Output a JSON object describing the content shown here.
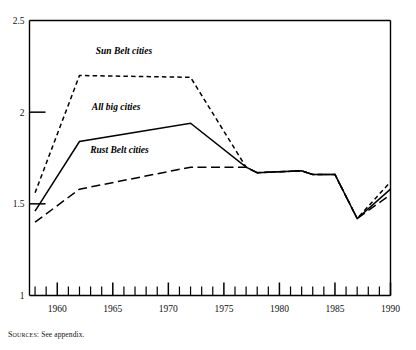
{
  "figure": {
    "source_note_prefix": "Sources:",
    "source_note_text": " See appendix."
  },
  "chart_data": {
    "type": "line",
    "title": "",
    "subtitle": "",
    "xlabel": "",
    "ylabel": "",
    "xlim": [
      1957.5,
      1990
    ],
    "ylim": [
      1,
      2.5
    ],
    "grid": false,
    "legend_position": "inline-annotations",
    "y_ticks": [
      1,
      1.5,
      2,
      2.5
    ],
    "y_tick_labels": [
      "1",
      "1.5",
      "2",
      "2.5"
    ],
    "x_ticks": [
      1958,
      1959,
      1960,
      1961,
      1962,
      1963,
      1964,
      1965,
      1966,
      1967,
      1968,
      1969,
      1970,
      1971,
      1972,
      1973,
      1974,
      1975,
      1976,
      1977,
      1978,
      1979,
      1980,
      1981,
      1982,
      1983,
      1984,
      1985,
      1986,
      1987,
      1988,
      1989,
      1990
    ],
    "x_major_ticks": [
      1960,
      1965,
      1970,
      1975,
      1980,
      1985,
      1990
    ],
    "x_tick_labels": [
      "1960",
      "1965",
      "1970",
      "1975",
      "1980",
      "1985",
      "1990"
    ],
    "x": [
      1958,
      1962,
      1972,
      1977,
      1978,
      1982,
      1983,
      1985,
      1987,
      1990
    ],
    "series": [
      {
        "name": "Sun Belt cities",
        "style": "short-dash",
        "color": "#000000",
        "label_x": 1966.0,
        "label_y": 2.32,
        "values": [
          1.56,
          2.2,
          2.19,
          1.7,
          1.67,
          1.68,
          1.66,
          1.66,
          1.42,
          1.62
        ]
      },
      {
        "name": "All big cities",
        "style": "solid",
        "color": "#000000",
        "label_x": 1965.3,
        "label_y": 2.01,
        "values": [
          1.46,
          1.84,
          1.94,
          1.7,
          1.67,
          1.68,
          1.66,
          1.66,
          1.42,
          1.58
        ]
      },
      {
        "name": "Rust Belt cities",
        "style": "long-dash",
        "color": "#000000",
        "label_x": 1965.6,
        "label_y": 1.78,
        "values": [
          1.4,
          1.58,
          1.7,
          1.7,
          1.67,
          1.68,
          1.66,
          1.66,
          1.42,
          1.55
        ]
      }
    ]
  }
}
